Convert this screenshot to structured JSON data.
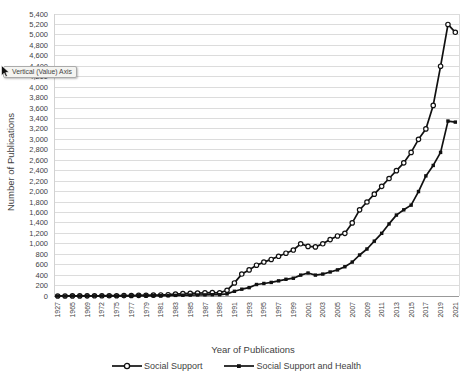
{
  "tooltip": {
    "text": "Vertical (Value) Axis"
  },
  "colors": {
    "series": "#111111",
    "gridline": "#dcdcdc",
    "axis_line": "#999999",
    "plot_border": "#d2d2d2",
    "label": "#3f3f3f",
    "tooltip_bg": "#f4f4f1",
    "tooltip_border": "#ababab"
  },
  "chart_data": {
    "type": "line",
    "title": "",
    "xlabel": "Year of Publications",
    "ylabel": "Number of Publications",
    "ylim": [
      0,
      5400
    ],
    "ytick_step": 200,
    "grid": "horizontal",
    "legend_position": "bottom",
    "x_label_every": 2,
    "y_tick_labels": [
      "0",
      "200",
      "400",
      "600",
      "800",
      "1,000",
      "1,200",
      "1,400",
      "1,600",
      "1,800",
      "2,000",
      "2,200",
      "2,400",
      "2,600",
      "2,800",
      "3,000",
      "3,200",
      "3,400",
      "3,600",
      "3,800",
      "4,000",
      "4,200",
      "4,400",
      "4,600",
      "4,800",
      "5,000",
      "5,200",
      "5,400"
    ],
    "categories": [
      "1927",
      "1957",
      "1965",
      "1967",
      "1969",
      "1971",
      "1972",
      "1974",
      "1975",
      "1976",
      "1977",
      "1978",
      "1979",
      "1980",
      "1981",
      "1982",
      "1983",
      "1984",
      "1985",
      "1986",
      "1987",
      "1988",
      "1989",
      "1990",
      "1991",
      "1992",
      "1993",
      "1994",
      "1995",
      "1996",
      "1997",
      "1998",
      "1999",
      "2000",
      "2001",
      "2002",
      "2003",
      "2004",
      "2005",
      "2006",
      "2007",
      "2008",
      "2009",
      "2010",
      "2011",
      "2012",
      "2013",
      "2014",
      "2015",
      "2016",
      "2017",
      "2018",
      "2019",
      "2020",
      "2021"
    ],
    "visible_x_labels": [
      "1927",
      "1965",
      "1969",
      "1972",
      "1975",
      "1977",
      "1979",
      "1981",
      "1983",
      "1985",
      "1987",
      "1989",
      "1991",
      "1993",
      "1995",
      "1997",
      "1999",
      "2001",
      "2003",
      "2005",
      "2007",
      "2009",
      "2011",
      "2013",
      "2015",
      "2017",
      "2019",
      "2021"
    ],
    "series": [
      {
        "name": "Social Support",
        "marker": "open-circle",
        "color": "#111111",
        "values": [
          1,
          1,
          2,
          2,
          3,
          4,
          4,
          5,
          6,
          8,
          10,
          12,
          14,
          16,
          20,
          25,
          35,
          45,
          50,
          55,
          60,
          65,
          60,
          110,
          250,
          420,
          500,
          590,
          650,
          700,
          760,
          820,
          880,
          1000,
          950,
          940,
          1000,
          1080,
          1150,
          1200,
          1400,
          1650,
          1800,
          1950,
          2100,
          2250,
          2400,
          2550,
          2750,
          3000,
          3200,
          3650,
          4400,
          5200,
          5050
        ]
      },
      {
        "name": "Social Support and Health",
        "marker": "filled-square",
        "color": "#111111",
        "values": [
          0,
          0,
          1,
          1,
          1,
          2,
          2,
          2,
          3,
          3,
          4,
          5,
          6,
          7,
          8,
          10,
          12,
          15,
          18,
          20,
          22,
          25,
          25,
          40,
          90,
          130,
          160,
          220,
          240,
          260,
          290,
          320,
          340,
          400,
          440,
          400,
          420,
          460,
          500,
          560,
          650,
          785,
          900,
          1050,
          1200,
          1380,
          1550,
          1650,
          1740,
          2000,
          2300,
          2500,
          2750,
          3350,
          3330
        ]
      }
    ]
  }
}
